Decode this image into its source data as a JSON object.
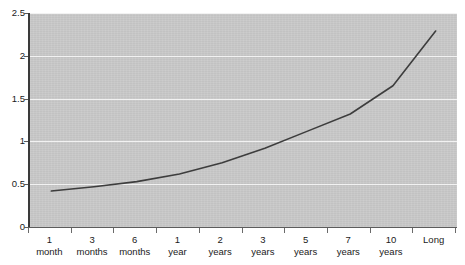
{
  "chart_data": {
    "type": "line",
    "title": "",
    "subtitle": "",
    "xlabel": "",
    "ylabel": "",
    "grid": true,
    "legend": false,
    "ylim": [
      0,
      2.5
    ],
    "yticks": [
      "0",
      "0.5",
      "1",
      "1.5",
      "2",
      "2.5"
    ],
    "ytick_values": [
      0,
      0.5,
      1,
      1.5,
      2,
      2.5
    ],
    "categories": [
      "1 month",
      "3 months",
      "6 months",
      "1 year",
      "2 years",
      "3 years",
      "5 years",
      "7 years",
      "10 years",
      "Long"
    ],
    "category_lines": [
      [
        "1",
        "month"
      ],
      [
        "3",
        "months"
      ],
      [
        "6",
        "months"
      ],
      [
        "1",
        "year"
      ],
      [
        "2",
        "years"
      ],
      [
        "3",
        "years"
      ],
      [
        "5",
        "years"
      ],
      [
        "7",
        "years"
      ],
      [
        "10",
        "years"
      ],
      [
        "Long",
        ""
      ]
    ],
    "series": [
      {
        "name": "Yield",
        "values": [
          0.42,
          0.47,
          0.53,
          0.62,
          0.75,
          0.92,
          1.12,
          1.32,
          1.65,
          2.29
        ]
      }
    ],
    "line_color": "#3d3d3d",
    "plot_background": "#c9c9c9",
    "gridline_color": "#f2f2f2",
    "axis_color": "#5c5c5c"
  }
}
